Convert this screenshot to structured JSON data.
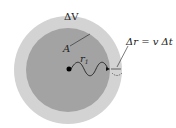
{
  "labels": {
    "volume": "ΔV",
    "area": "A",
    "radius": "r",
    "radius_sub": "1",
    "shell": "Δr = v Δt"
  },
  "colors": {
    "outer": "#cfcfcf",
    "inner": "#a0a0a0",
    "ink": "#111111"
  }
}
